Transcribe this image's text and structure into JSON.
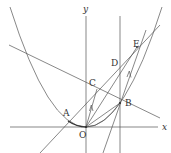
{
  "diagram": {
    "type": "coordinate-geometry",
    "axes": {
      "x_label": "x",
      "y_label": "y",
      "origin_label": "O"
    },
    "points": [
      {
        "id": "O",
        "label": "O"
      },
      {
        "id": "A",
        "label": "A"
      },
      {
        "id": "B",
        "label": "B"
      },
      {
        "id": "C",
        "label": "C"
      },
      {
        "id": "D",
        "label": "D"
      },
      {
        "id": "E",
        "label": "E"
      }
    ],
    "curves": [
      {
        "id": "parabola",
        "description": "parabola with vertex at O"
      }
    ],
    "lines": [
      {
        "id": "line-ACB",
        "description": "line through A, C and B"
      },
      {
        "id": "line-through-A-D-E",
        "description": "line parallel to OB direction through A and D/E region"
      },
      {
        "id": "line-vertical-B",
        "description": "vertical line through B and D"
      },
      {
        "id": "line-BE",
        "description": "steep line through B and E"
      },
      {
        "id": "segment-OC",
        "description": "segment O to C with arrow (parallel marker)"
      },
      {
        "id": "segment-OB",
        "description": "segment O to B"
      },
      {
        "id": "segment-OE",
        "description": "segment O to E"
      },
      {
        "id": "segment-BE-arrow",
        "description": "arrow marker on BE (parallel to OC)"
      }
    ],
    "colors": {
      "stroke": "#555555",
      "background": "#ffffff"
    }
  }
}
